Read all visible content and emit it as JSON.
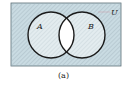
{
  "diagram": {
    "type": "venn",
    "universe_label": "U",
    "sets": [
      {
        "label": "A"
      },
      {
        "label": "B"
      }
    ],
    "shaded_region": "complement of A∩B",
    "unshaded_region": "A∩B",
    "caption": "(a)",
    "colors": {
      "universe_fill": "#c9dbe2",
      "circle_fill": "#e3ecef",
      "intersection_fill": "#ffffff",
      "outline": "#1a1a1a"
    }
  }
}
